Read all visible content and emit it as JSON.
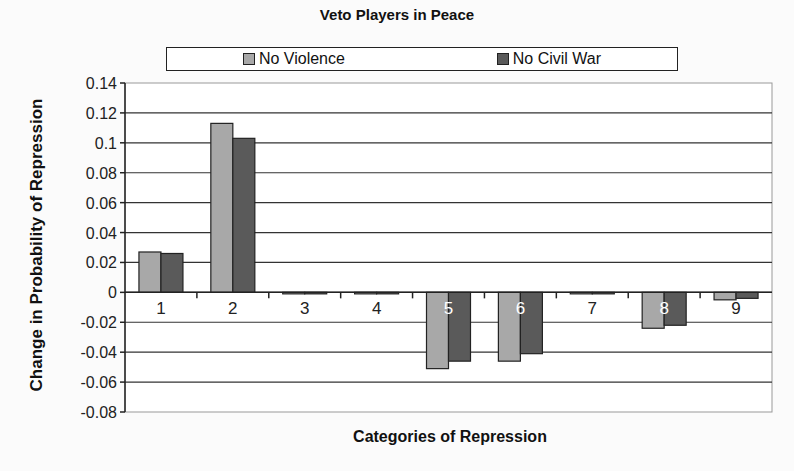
{
  "chart_data": {
    "type": "bar",
    "title": "Veto Players in Peace",
    "xlabel": "Categories of Repression",
    "ylabel": "Change in Probability of Repression",
    "categories": [
      "1",
      "2",
      "3",
      "4",
      "5",
      "6",
      "7",
      "8",
      "9"
    ],
    "series": [
      {
        "name": "No Violence",
        "color": "#a8a8a8",
        "values": [
          0.027,
          0.113,
          -0.001,
          -0.0005,
          -0.051,
          -0.046,
          -0.001,
          -0.024,
          -0.005
        ]
      },
      {
        "name": "No Civil War",
        "color": "#5a5a5a",
        "values": [
          0.026,
          0.103,
          -0.001,
          -0.0005,
          -0.046,
          -0.041,
          -0.001,
          -0.022,
          -0.004
        ]
      }
    ],
    "ylim": [
      -0.08,
      0.14
    ],
    "yticks": [
      "0.14",
      "0.12",
      "0.1",
      "0.08",
      "0.06",
      "0.04",
      "0.02",
      "0",
      "-0.02",
      "-0.04",
      "-0.06",
      "-0.08"
    ],
    "grid": true,
    "legend_position": "top"
  }
}
